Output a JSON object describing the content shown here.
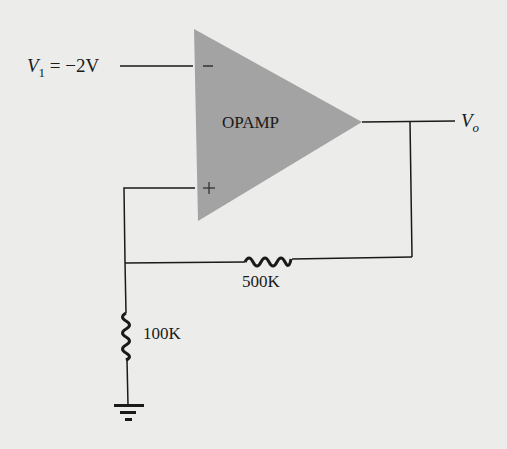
{
  "diagram": {
    "type": "circuit",
    "colors": {
      "background": "#ececea",
      "opamp_fill": "#a3a3a3",
      "wire": "#1a1a1a"
    },
    "opamp": {
      "label": "OPAMP",
      "inverting_symbol": "−",
      "noninverting_symbol": "+"
    },
    "input": {
      "name": "V",
      "subscript": "1",
      "equals": "= −2V"
    },
    "output": {
      "name": "V",
      "subscript": "o"
    },
    "resistors": [
      {
        "id": "feedback",
        "label": "500K"
      },
      {
        "id": "ground",
        "label": "100K"
      }
    ],
    "ground_symbol": "ground-icon"
  }
}
